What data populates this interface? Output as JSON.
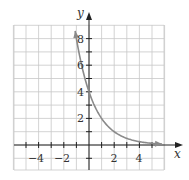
{
  "chart_data": {
    "type": "line",
    "title": "",
    "xlabel": "x",
    "ylabel": "y",
    "xlim": [
      -6,
      6
    ],
    "ylim": [
      -2,
      9
    ],
    "grid": true,
    "x_tick_labels": [
      "-4",
      "-2",
      "2",
      "4"
    ],
    "x_ticks": [
      -4,
      -2,
      2,
      4
    ],
    "y_tick_labels": [
      "2",
      "4",
      "6",
      "8"
    ],
    "y_ticks": [
      2,
      4,
      6,
      8
    ],
    "series": [
      {
        "name": "y = 4(1/2)^x",
        "x": [
          -1.1,
          -1,
          -0.5,
          0,
          0.5,
          1,
          1.5,
          2,
          3,
          4,
          5,
          5.8
        ],
        "values": [
          8.57,
          8,
          5.66,
          4,
          2.83,
          2,
          1.41,
          1,
          0.5,
          0.25,
          0.125,
          0.07
        ],
        "color": "#8a8a8a",
        "arrows": "both"
      }
    ],
    "legend": "none"
  },
  "colors": {
    "grid": "#c8c8c8",
    "axis": "#222222",
    "curve": "#8a8a8a"
  },
  "labels": {
    "x_axis": "x",
    "y_axis": "y",
    "x_ticks": [
      "−4",
      "−2",
      "2",
      "4"
    ],
    "y_ticks": [
      "2",
      "4",
      "6",
      "8"
    ]
  }
}
